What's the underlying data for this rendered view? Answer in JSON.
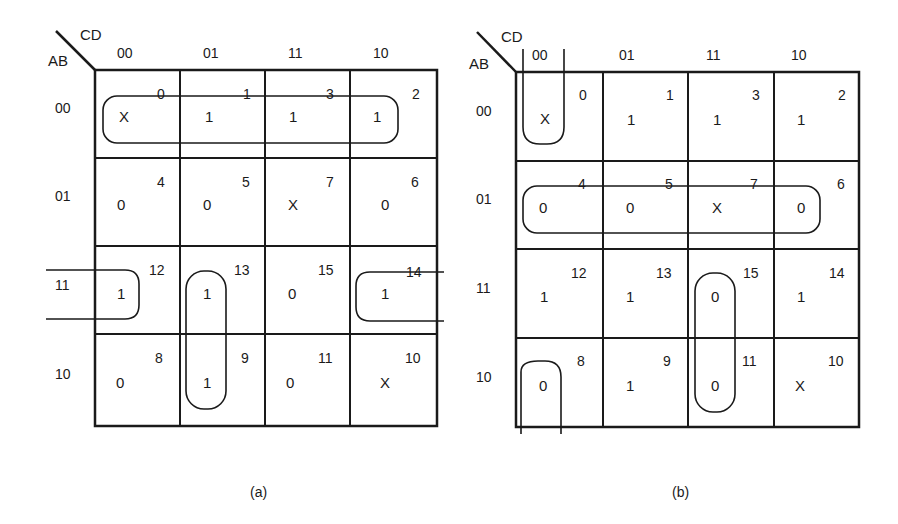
{
  "maps": [
    {
      "id": "a",
      "caption": "(a)",
      "row_var": "AB",
      "col_var": "CD",
      "col_labels": [
        "00",
        "01",
        "11",
        "10"
      ],
      "row_labels": [
        "00",
        "01",
        "11",
        "10"
      ],
      "cells": [
        [
          {
            "m": "0",
            "v": "X"
          },
          {
            "m": "1",
            "v": "1"
          },
          {
            "m": "3",
            "v": "1"
          },
          {
            "m": "2",
            "v": "1"
          }
        ],
        [
          {
            "m": "4",
            "v": "0"
          },
          {
            "m": "5",
            "v": "0"
          },
          {
            "m": "7",
            "v": "X"
          },
          {
            "m": "6",
            "v": "0"
          }
        ],
        [
          {
            "m": "12",
            "v": "1"
          },
          {
            "m": "13",
            "v": "1"
          },
          {
            "m": "15",
            "v": "0"
          },
          {
            "m": "14",
            "v": "1"
          }
        ],
        [
          {
            "m": "8",
            "v": "0"
          },
          {
            "m": "9",
            "v": "1"
          },
          {
            "m": "11",
            "v": "0"
          },
          {
            "m": "10",
            "v": "X"
          }
        ]
      ],
      "groupings": [
        {
          "cells": [
            0,
            1,
            3,
            2
          ],
          "desc": "row AB=00 (quad of 1s incl. X)"
        },
        {
          "cells": [
            12,
            14
          ],
          "desc": "wrap-around row AB=11, columns 00 and 10"
        },
        {
          "cells": [
            13,
            9
          ],
          "desc": "column CD=01, rows 11 and 10"
        }
      ]
    },
    {
      "id": "b",
      "caption": "(b)",
      "row_var": "AB",
      "col_var": "CD",
      "col_labels": [
        "00",
        "01",
        "11",
        "10"
      ],
      "row_labels": [
        "00",
        "01",
        "11",
        "10"
      ],
      "cells": [
        [
          {
            "m": "0",
            "v": "X"
          },
          {
            "m": "1",
            "v": "1"
          },
          {
            "m": "3",
            "v": "1"
          },
          {
            "m": "2",
            "v": "1"
          }
        ],
        [
          {
            "m": "4",
            "v": "0"
          },
          {
            "m": "5",
            "v": "0"
          },
          {
            "m": "7",
            "v": "X"
          },
          {
            "m": "6",
            "v": "0"
          }
        ],
        [
          {
            "m": "12",
            "v": "1"
          },
          {
            "m": "13",
            "v": "1"
          },
          {
            "m": "15",
            "v": "0"
          },
          {
            "m": "14",
            "v": "1"
          }
        ],
        [
          {
            "m": "8",
            "v": "0"
          },
          {
            "m": "9",
            "v": "1"
          },
          {
            "m": "11",
            "v": "0"
          },
          {
            "m": "10",
            "v": "X"
          }
        ]
      ],
      "groupings": [
        {
          "cells": [
            0,
            8
          ],
          "desc": "wrap-around column CD=00, rows 00 and 10 (0s incl. X)"
        },
        {
          "cells": [
            4,
            5,
            7,
            6
          ],
          "desc": "row AB=01 (quad of 0s incl. X)"
        },
        {
          "cells": [
            15,
            11
          ],
          "desc": "column CD=11, rows 11 and 10"
        }
      ]
    }
  ]
}
